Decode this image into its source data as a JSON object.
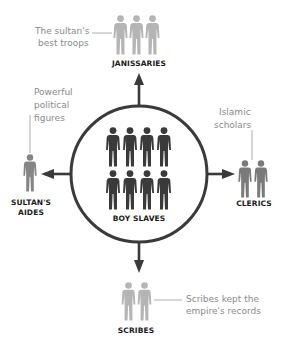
{
  "diagram": {
    "center": {
      "label": "BOY SLAVES",
      "figure_count": 8,
      "figure_color": "#3a3a3a"
    },
    "nodes": [
      {
        "id": "janissaries",
        "label": "JANISSARIES",
        "direction": "up",
        "figure_count": 3,
        "figure_color": "#b5b5b5",
        "note": "The sultan's best troops"
      },
      {
        "id": "aides",
        "label_line1": "SULTAN'S",
        "label_line2": "AIDES",
        "direction": "left",
        "figure_count": 1,
        "figure_color": "#858585",
        "note_line1": "Powerful",
        "note_line2": "political",
        "note_line3": "figures"
      },
      {
        "id": "clerics",
        "label": "CLERICS",
        "direction": "right",
        "figure_count": 2,
        "figure_color": "#7a7a7a",
        "note_line1": "Islamic",
        "note_line2": "scholars"
      },
      {
        "id": "scribes",
        "label": "SCRIBES",
        "direction": "down",
        "figure_count": 2,
        "figure_color": "#b5b5b5",
        "note_line1": "Scribes kept the",
        "note_line2": "empire's records"
      }
    ],
    "colors": {
      "circle_stroke": "#3a3a3a",
      "arrow": "#3a3a3a",
      "leader_line": "#9a9a9a",
      "note_text": "#8a8a8a",
      "label_text": "#1a1a1a"
    }
  },
  "labels": {
    "center": "BOY SLAVES",
    "janissaries": "JANISSARIES",
    "aides_1": "SULTAN'S",
    "aides_2": "AIDES",
    "clerics": "CLERICS",
    "scribes": "SCRIBES"
  },
  "notes": {
    "janissaries_1": "The sultan's",
    "janissaries_2": "best troops",
    "aides_1": "Powerful",
    "aides_2": "political",
    "aides_3": "figures",
    "clerics_1": "Islamic",
    "clerics_2": "scholars",
    "scribes_1": "Scribes kept the",
    "scribes_2": "empire's records"
  }
}
